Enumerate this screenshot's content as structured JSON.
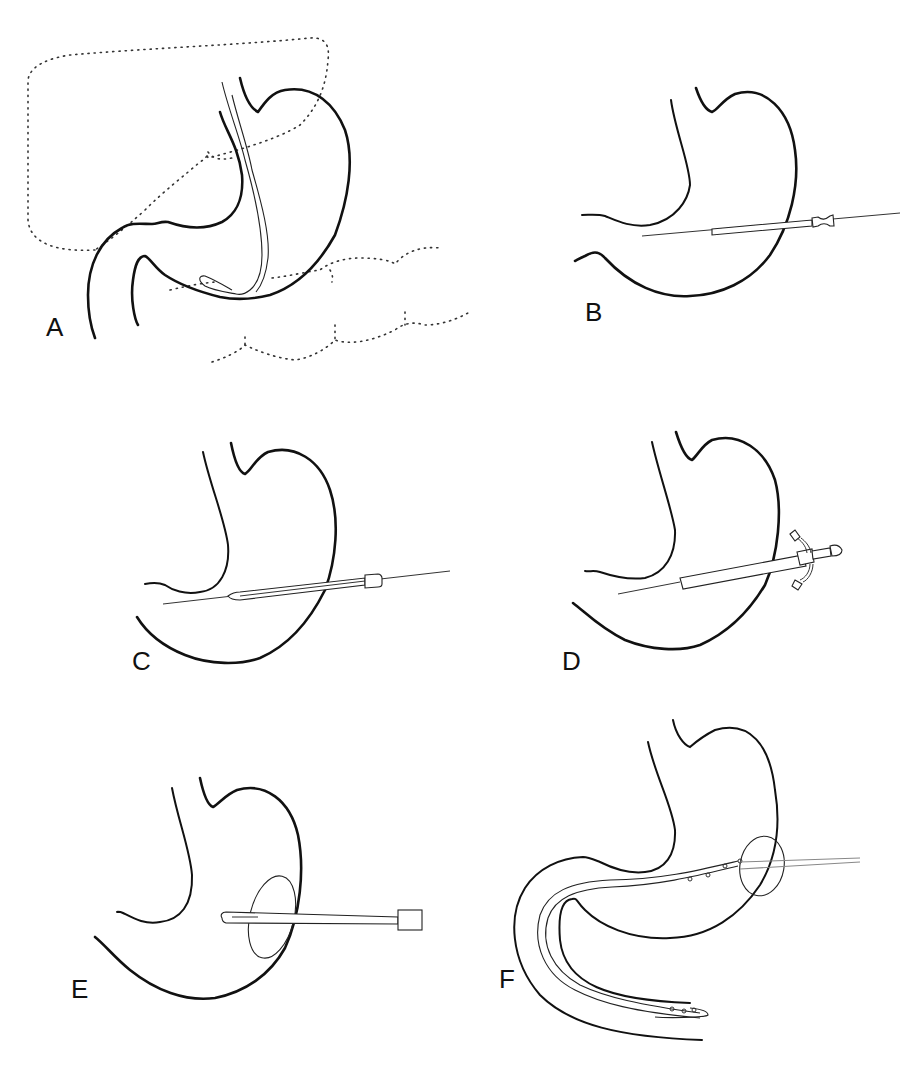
{
  "figure": {
    "panels": [
      {
        "id": "A",
        "label": "A",
        "content": "Stomach with endoscope, liver and colon outlined (dotted)"
      },
      {
        "id": "B",
        "label": "B",
        "content": "Needle/cannula inserted through abdominal and stomach wall"
      },
      {
        "id": "C",
        "label": "C",
        "content": "Guidewire with dilator sheath advanced into stomach"
      },
      {
        "id": "D",
        "label": "D",
        "content": "Sheath with double-port catheter introducer"
      },
      {
        "id": "E",
        "label": "E",
        "content": "Gastrostomy tube with retention disc in stomach"
      },
      {
        "id": "F",
        "label": "F",
        "content": "Gastrojejunostomy tube extending through duodenum"
      }
    ]
  },
  "colors": {
    "background": "#ffffff",
    "line": "#111111"
  }
}
